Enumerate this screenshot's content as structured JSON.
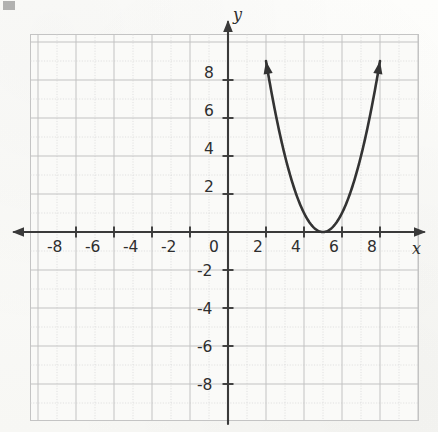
{
  "figure": {
    "kind": "coordinate-plane-graph",
    "background_color": "#fbfbf9",
    "curve_color": "#333333",
    "axis_color": "#3a3a3a",
    "major_grid_color": "#c9c9c9",
    "minor_grid_color": "#dcdcdc",
    "axis_labels": {
      "x": "x",
      "y": "y"
    },
    "x_axis": {
      "tick_labels": [
        "-8",
        "-6",
        "-4",
        "-2",
        "0",
        "2",
        "4",
        "6",
        "8"
      ],
      "tick_values": [
        -8,
        -6,
        -4,
        -2,
        0,
        2,
        4,
        6,
        8
      ],
      "min": -10,
      "max": 10,
      "minor_step": 1,
      "major_step": 2
    },
    "y_axis": {
      "tick_labels": [
        "8",
        "6",
        "4",
        "2",
        "-2",
        "-4",
        "-6",
        "-8"
      ],
      "tick_values": [
        8,
        6,
        4,
        2,
        -2,
        -4,
        -6,
        -8
      ],
      "min": -10,
      "max": 10,
      "minor_step": 1,
      "major_step": 2
    },
    "origin_label": "0"
  },
  "chart_data": {
    "type": "line",
    "title": "",
    "xlabel": "x",
    "ylabel": "y",
    "xlim": [
      -10,
      10
    ],
    "ylim": [
      -10,
      10
    ],
    "grid": true,
    "legend": "none",
    "annotations": [
      "parabola opening upward",
      "vertex at (5, 0)",
      "arrowheads on both ends"
    ],
    "series": [
      {
        "name": "y = (x - 5)^2",
        "curve_type": "parabola",
        "vertex": [
          5,
          0
        ],
        "leading_coefficient": 1,
        "axis_of_symmetry": 5,
        "x_intercepts": [
          5
        ],
        "opens": "up",
        "arrow_start": [
          2.0,
          9.5
        ],
        "arrow_end": [
          8.0,
          9.5
        ],
        "x": [
          2.0,
          2.5,
          3.0,
          3.5,
          4.0,
          4.5,
          5.0,
          5.5,
          6.0,
          6.5,
          7.0,
          7.5,
          8.0
        ],
        "values": [
          9.0,
          6.25,
          4.0,
          2.25,
          1.0,
          0.25,
          0.0,
          0.25,
          1.0,
          2.25,
          4.0,
          6.25,
          9.0
        ]
      }
    ]
  }
}
